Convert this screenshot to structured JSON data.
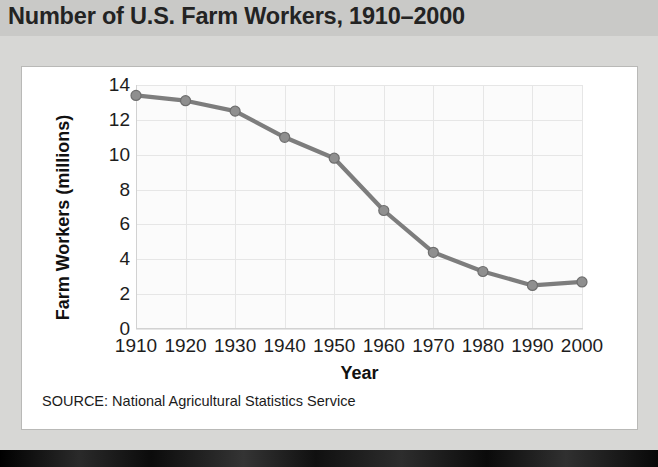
{
  "title": "Number of U.S. Farm Workers, 1910–2000",
  "source_note": "SOURCE: National Agricultural Statistics Service",
  "colors": {
    "title_band": "#c9c9c7",
    "page_background": "#d7d7d5",
    "panel_background": "#ffffff",
    "plot_background": "#fbfbfb",
    "gridline": "#e6e6e6",
    "series_line": "#7d7d7d",
    "marker_fill": "#8f8f8f",
    "marker_stroke": "#6e6e6e",
    "text": "#1d1d1d",
    "bottom_band": "#111111"
  },
  "chart_data": {
    "type": "line",
    "title": "Number of U.S. Farm Workers, 1910–2000",
    "xlabel": "Year",
    "ylabel": "Farm Workers (millions)",
    "categories": [
      1910,
      1920,
      1930,
      1940,
      1950,
      1960,
      1970,
      1980,
      1990,
      2000
    ],
    "xticklabels": [
      "1910",
      "1920",
      "1930",
      "1940",
      "1950",
      "1960",
      "1970",
      "1980",
      "1990",
      "2000"
    ],
    "values": [
      13.4,
      13.1,
      12.5,
      11.0,
      9.8,
      6.8,
      4.4,
      3.3,
      2.5,
      2.7
    ],
    "yticklabels": [
      "0",
      "2",
      "4",
      "6",
      "8",
      "10",
      "12",
      "14"
    ],
    "yticks": [
      0,
      2,
      4,
      6,
      8,
      10,
      12,
      14
    ],
    "ylim": [
      0,
      14
    ],
    "xlim": [
      1910,
      2000
    ],
    "grid": true,
    "legend": false,
    "marker": "circle",
    "source": "National Agricultural Statistics Service"
  }
}
